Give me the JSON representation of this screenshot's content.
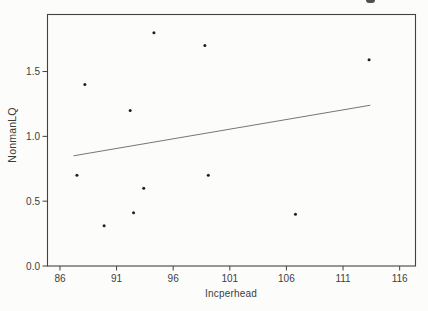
{
  "figure": {
    "background": "#fcfcfa",
    "stray_mark_present": true
  },
  "chart_data": {
    "type": "scatter",
    "title": "",
    "xlabel": "Incperhead",
    "ylabel": "NonmanLQ",
    "xlim": [
      84.9,
      117.4
    ],
    "ylim": [
      0,
      1.94
    ],
    "grid": false,
    "legend": null,
    "xticks": {
      "values": [
        86,
        91,
        96,
        101,
        106,
        111,
        116
      ],
      "labels": [
        "86",
        "91",
        "96",
        "101",
        "106",
        "111",
        "116"
      ]
    },
    "yticks": {
      "values": [
        0.0,
        0.5,
        1.0,
        1.5
      ],
      "labels": [
        "0.0",
        "0.5",
        "1.0",
        "1.5"
      ]
    },
    "points": [
      [
        88.2,
        1.4
      ],
      [
        94.3,
        1.8
      ],
      [
        98.8,
        1.7
      ],
      [
        92.2,
        1.2
      ],
      [
        113.3,
        1.59
      ],
      [
        87.5,
        0.7
      ],
      [
        93.4,
        0.6
      ],
      [
        92.5,
        0.41
      ],
      [
        89.9,
        0.31
      ],
      [
        99.1,
        0.7
      ],
      [
        106.8,
        0.4
      ]
    ],
    "fit_line": {
      "x1": 87.2,
      "y1": 0.85,
      "x2": 113.4,
      "y2": 1.24
    },
    "colors": {
      "marker": "#1f1f1f",
      "fit_line": "#666666",
      "frame": "#424242",
      "tick": "#424242",
      "text": "#3d3d3d"
    }
  }
}
